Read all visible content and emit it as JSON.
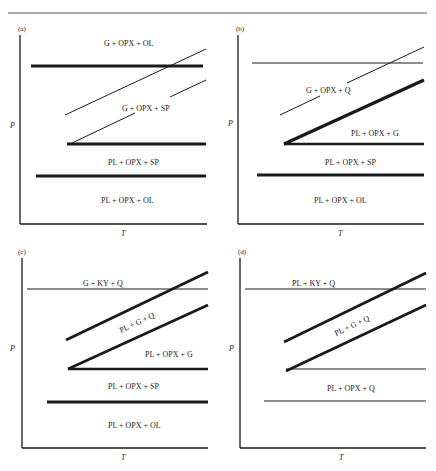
{
  "figure": {
    "rule_color": "#555555",
    "ink_color": "#1a1a1a",
    "panels": [
      {
        "id": "a",
        "tag": "(a)",
        "x_axis_label": "T",
        "y_axis_label": "P",
        "field_labels": {
          "top": "G + OPX + OL",
          "mid": "G + OPX + SP",
          "lower": "PL + OPX + SP",
          "bottom": "PL + OPX + OL"
        }
      },
      {
        "id": "b",
        "tag": "(b)",
        "x_axis_label": "T",
        "y_axis_label": "P",
        "field_labels": {
          "upper": "G + OPX + Q",
          "mid": "PL + OPX + G",
          "lower": "PL + OPX + SP",
          "bottom": "PL + OPX + OL"
        }
      },
      {
        "id": "c",
        "tag": "(c)",
        "x_axis_label": "T",
        "y_axis_label": "P",
        "field_labels": {
          "top": "G + KY + Q",
          "diag": "PL + G + Q",
          "mid": "PL + OPX + G",
          "lower": "PL + OPX + SP",
          "bottom": "PL + OPX + OL"
        }
      },
      {
        "id": "d",
        "tag": "(d)",
        "x_axis_label": "T",
        "y_axis_label": "P",
        "field_labels": {
          "top": "PL + KY + Q",
          "diag": "PL + G + Q",
          "lower": "PL + OPX + Q"
        }
      }
    ]
  }
}
